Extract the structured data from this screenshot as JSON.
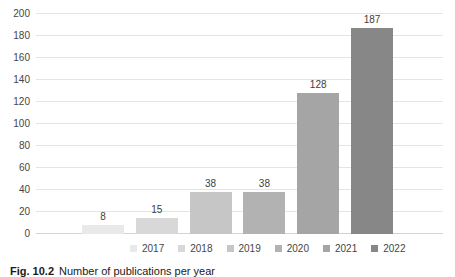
{
  "figure": {
    "caption_label": "Fig. 10.2",
    "caption_text": "Number of publications per year"
  },
  "chart_data": {
    "type": "bar",
    "title": "",
    "xlabel": "",
    "ylabel": "",
    "categories": [
      "2017",
      "2018",
      "2019",
      "2020",
      "2021",
      "2022"
    ],
    "values": [
      8,
      15,
      38,
      38,
      128,
      187
    ],
    "data_labels": [
      "8",
      "15",
      "38",
      "38",
      "128",
      "187"
    ],
    "bar_colors": [
      "#e9e9e9",
      "#d8d8d8",
      "#c6c6c6",
      "#b2b2b2",
      "#a5a5a5",
      "#878787"
    ],
    "ylim": [
      0,
      200
    ],
    "yticks": [
      0,
      20,
      40,
      60,
      80,
      100,
      120,
      140,
      160,
      180,
      200
    ],
    "grid": "horizontal",
    "gridline_color": "#e4e4e4",
    "axis_label_color": "#464646",
    "legend_position": "bottom",
    "legend_entries": [
      "2017",
      "2018",
      "2019",
      "2020",
      "2021",
      "2022"
    ]
  }
}
